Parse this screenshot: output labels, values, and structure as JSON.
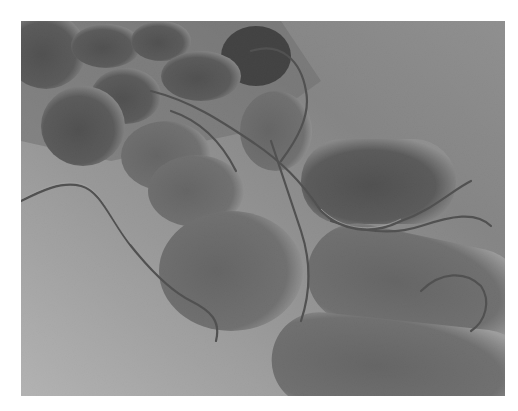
{
  "image": {
    "description": "Grayscale scanning electron micrograph of rod-shaped bacteria with flagella on a textured surface",
    "colors": {
      "background": "#ffffff",
      "surface_light": "#c8c8c8",
      "surface_mid": "#8c8c8c",
      "cell_dark": "#2a2a2a",
      "cell_mid": "#555555"
    }
  }
}
